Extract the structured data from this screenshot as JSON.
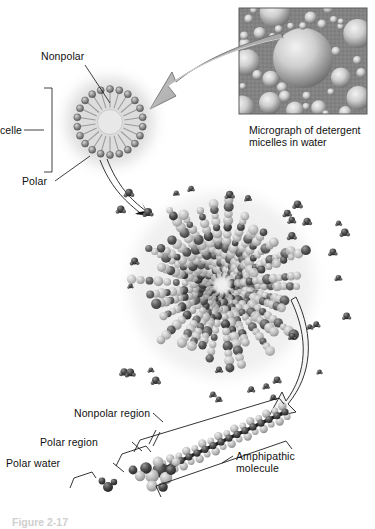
{
  "figure": {
    "title_caption": "Figure 2-17",
    "background_color": "#ffffff",
    "ink_color": "#111111",
    "arrow_fill": "#b9b9b9",
    "arrow_stroke": "#6e6e6e",
    "bead_color": "#8a8a8a",
    "bead_dark": "#5d5d5d",
    "halo_color": "#cfcfcf",
    "micrograph_color": "#9a9a9a"
  },
  "micrograph": {
    "caption_line1": "Micrograph of detergent",
    "caption_line2": "micelles in water",
    "alt_name": "micrograph-detergent-micelles",
    "bubble_count": 38
  },
  "micelle_diagram": {
    "label_nonpolar": "Nonpolar",
    "label_micelle": "Micelle",
    "label_polar": "Polar",
    "head_count": 22
  },
  "central_micelle": {
    "name": "space-filling-micelle",
    "spoke_count": 34,
    "water_dot_count": 46
  },
  "molecule": {
    "label_nonpolar_region": "Nonpolar region",
    "label_polar_region": "Polar region",
    "label_polar_water": "Polar water",
    "label_amphipathic_line1": "Amphipathic",
    "label_amphipathic_line2": "molecule",
    "tail_carbon_count": 16
  }
}
